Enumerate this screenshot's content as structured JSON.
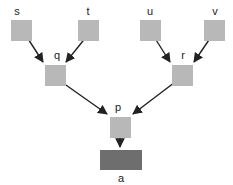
{
  "diagram": {
    "type": "tree",
    "colors": {
      "node_fill": "#b8b8b8",
      "root_fill": "#6e6e6e",
      "edge": "#222222",
      "label": "#222222"
    },
    "nodes": [
      {
        "id": "s",
        "label": "s",
        "kind": "leaf"
      },
      {
        "id": "t",
        "label": "t",
        "kind": "leaf"
      },
      {
        "id": "u",
        "label": "u",
        "kind": "leaf"
      },
      {
        "id": "v",
        "label": "v",
        "kind": "leaf"
      },
      {
        "id": "q",
        "label": "q",
        "kind": "internal"
      },
      {
        "id": "r",
        "label": "r",
        "kind": "internal"
      },
      {
        "id": "p",
        "label": "p",
        "kind": "internal"
      },
      {
        "id": "a",
        "label": "a",
        "kind": "root"
      }
    ],
    "edges": [
      {
        "from": "s",
        "to": "q"
      },
      {
        "from": "t",
        "to": "q"
      },
      {
        "from": "u",
        "to": "r"
      },
      {
        "from": "v",
        "to": "r"
      },
      {
        "from": "q",
        "to": "p"
      },
      {
        "from": "r",
        "to": "p"
      },
      {
        "from": "p",
        "to": "a"
      }
    ]
  }
}
